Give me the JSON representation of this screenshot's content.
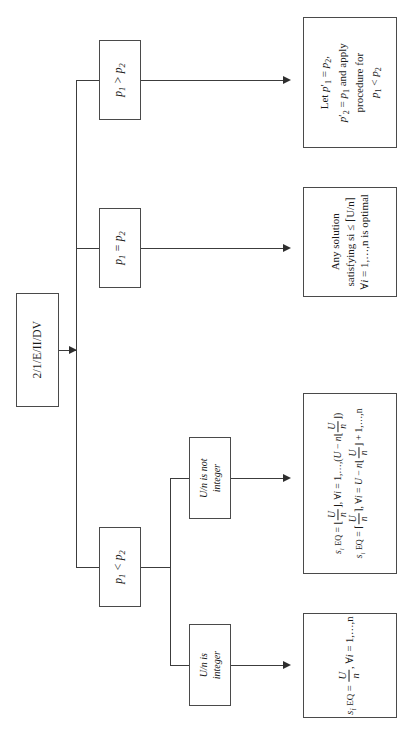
{
  "diagram": {
    "type": "flowchart",
    "orientation": "rotated-90-ccw",
    "title_node": {
      "label": "2/1/E/II/DV"
    },
    "branches": [
      {
        "condition": "p₁ > p₂",
        "outcome": "Let p′₁ = p₂, p′₂ = p₁ and apply procedure for p₁ < p₂"
      },
      {
        "condition": "p₁ = p₂",
        "outcome": "Any solution satisfying si ≤ ⌈U/n⌉ ∀i = 1,…,n is optimal"
      },
      {
        "condition": "p₁ < p₂",
        "sub_branches": [
          {
            "condition": "U/n is not integer",
            "outcome": "si_EQ = ⌊U/n⌋, ∀i = 1,…,(U − n⌊U/n⌋)    si_EQ = ⌈U/n⌉, ∀i = U − n⌊U/n⌋ + 1,…,n"
          },
          {
            "condition": "U/n is integer",
            "outcome": "si_EQ = U/n, ∀i = 1,…,n"
          }
        ]
      }
    ]
  },
  "nodes": {
    "start": "2/1/E/II/DV",
    "cond_gt": {
      "lhs": "p",
      "lhs_sub": "1",
      "op": ">",
      "rhs": "p",
      "rhs_sub": "2"
    },
    "cond_eq": {
      "lhs": "p",
      "lhs_sub": "1",
      "op": "=",
      "rhs": "p",
      "rhs_sub": "2"
    },
    "cond_lt": {
      "lhs": "p",
      "lhs_sub": "1",
      "op": "<",
      "rhs": "p",
      "rhs_sub": "2"
    },
    "sub_not_integer": {
      "line1": "U/n is not",
      "line2": "integer"
    },
    "sub_integer": {
      "line1": "U/n is",
      "line2": "integer"
    },
    "out_swap": {
      "line1_pre": "Let ",
      "line1": "p′1 = p2,",
      "line2": "p′2 = p1 and apply",
      "line3": "procedure for",
      "line4": "p1 < p2"
    },
    "out_any": {
      "line1": "Any solution",
      "line2": "satisfying si ≤ ⌈U/n⌉",
      "line3": "∀i = 1,…,n is optimal"
    },
    "out_floorceil": {
      "line1": "si EQ = ⌊U/n⌋, ∀i = 1,…,(U − n⌊U/n⌋)",
      "line2": "si EQ = ⌈U/n⌉, ∀i = U − n⌊U/n⌋ + 1,…,n"
    },
    "out_exact": {
      "line1": "si EQ = U/n, ∀i = 1,…,n"
    }
  },
  "style": {
    "background": "#ffffff",
    "border_color": "#4a4a4a",
    "line_color": "#3c3c3c",
    "text_color": "#1a1a1a"
  }
}
